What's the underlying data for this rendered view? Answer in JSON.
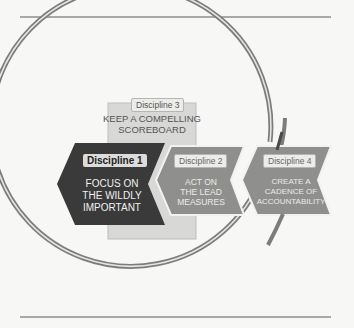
{
  "diagram": {
    "disciplines": [
      {
        "badge": "Discipline 1",
        "text": [
          "FOCUS ON",
          "THE WILDLY",
          "IMPORTANT"
        ],
        "fill": "#3a3a3a"
      },
      {
        "badge": "Discipline 2",
        "text": [
          "ACT ON",
          "THE LEAD",
          "MEASURES"
        ],
        "fill": "#8f8f8d"
      },
      {
        "badge": "Discipline 3",
        "text": [
          "KEEP A COMPELLING",
          "SCOREBOARD"
        ],
        "fill": "#d8d8d6"
      },
      {
        "badge": "Discipline 4",
        "text": [
          "CREATE A",
          "CADENCE OF",
          "ACCOUNTABILITY"
        ],
        "fill": "#8f8f8d"
      }
    ],
    "cycle_ring": {
      "color": "#8a8a88",
      "highlight": "#e6e6e4"
    },
    "colors": {
      "dark": "#3a3a3a",
      "mid": "#8f8f8d",
      "light": "#d8d8d6",
      "line": "#a8a8a6"
    }
  }
}
